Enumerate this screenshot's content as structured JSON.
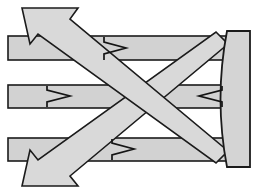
{
  "figure": {
    "title": "Concave mirror ray diagram",
    "background_color": "#ffffff",
    "fill_color": "#d2d2d2",
    "outline_color": "#1b1b1b",
    "canvas": {
      "width": 255,
      "height": 194
    }
  },
  "elements": {
    "mirror": {
      "label": "concave-mirror",
      "direction": "concave-left",
      "x_front": 216,
      "x_back": 250,
      "y_top": 30,
      "y_bottom": 168
    },
    "incident_beams": [
      {
        "label": "incident-beam-top",
        "direction": "right",
        "y_top": 36,
        "y_bottom": 60,
        "x_start": 8,
        "x_end": 228
      },
      {
        "label": "incident-beam-middle",
        "direction": "right",
        "y_top": 85,
        "y_bottom": 108,
        "x_start": 8,
        "x_end": 228
      },
      {
        "label": "incident-beam-bottom",
        "direction": "right",
        "y_top": 138,
        "y_bottom": 161,
        "x_start": 8,
        "x_end": 228
      }
    ],
    "reflected_beams": [
      {
        "label": "reflected-beam-upper-left",
        "direction": "upper-left",
        "tip_x": 22,
        "tip_y": 8
      },
      {
        "label": "reflected-beam-lower-left",
        "direction": "lower-left",
        "tip_x": 22,
        "tip_y": 186
      }
    ],
    "arrowheads": [
      {
        "label": "arrowhead-top-band",
        "direction": "right",
        "x": 104,
        "y": 48
      },
      {
        "label": "arrowhead-middle-band-right",
        "direction": "right",
        "x": 47,
        "y": 96
      },
      {
        "label": "arrowhead-middle-band-left",
        "direction": "left",
        "x": 214,
        "y": 96
      },
      {
        "label": "arrowhead-bottom-band",
        "direction": "right",
        "x": 112,
        "y": 149
      }
    ],
    "crossing_point": {
      "label": "focal-crossing",
      "x": 148,
      "y": 96
    }
  }
}
